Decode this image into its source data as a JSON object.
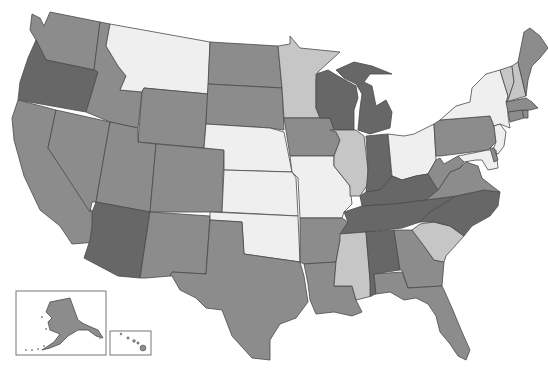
{
  "map": {
    "type": "choropleth",
    "region": "United States",
    "palette": {
      "very_light": "#efefef",
      "light": "#c6c6c6",
      "medium": "#8c8c8c",
      "dark": "#676767",
      "border": "#4a4a4a",
      "background": "#ffffff"
    },
    "insets": [
      {
        "name": "Alaska",
        "shade": "medium"
      },
      {
        "name": "Hawaii",
        "shade": "medium"
      }
    ],
    "states": [
      {
        "abbr": "WA",
        "shade": "medium",
        "points": "32,14 40,18 44,26 50,12 100,22 94,70 46,60 40,48 36,40 30,30"
      },
      {
        "abbr": "OR",
        "shade": "dark",
        "points": "36,40 46,60 94,70 98,72 86,112 18,100 20,82 28,58"
      },
      {
        "abbr": "CA",
        "shade": "medium",
        "points": "18,100 56,110 48,148 102,226 98,242 72,244 60,226 40,210 24,176 14,140 12,118"
      },
      {
        "abbr": "NV",
        "shade": "medium",
        "points": "56,110 110,122 96,202 92,202 90,212 48,148"
      },
      {
        "abbr": "ID",
        "shade": "medium",
        "points": "100,22 110,24 106,46 118,66 126,76 120,90 142,92 138,128 110,122 86,112 98,72 94,70"
      },
      {
        "abbr": "MT",
        "shade": "very_light",
        "points": "110,24 210,42 208,94 144,88 142,92 120,90 126,76 118,66 106,46"
      },
      {
        "abbr": "WY",
        "shade": "medium",
        "points": "144,88 208,94 204,148 138,142 142,92"
      },
      {
        "abbr": "UT",
        "shade": "medium",
        "points": "110,122 138,128 138,142 156,144 150,212 96,202"
      },
      {
        "abbr": "AZ",
        "shade": "dark",
        "points": "96,202 150,212 140,278 118,276 84,258 90,240 92,226 92,212"
      },
      {
        "abbr": "CO",
        "shade": "medium",
        "points": "156,144 224,150 222,212 150,212"
      },
      {
        "abbr": "NM",
        "shade": "medium",
        "points": "150,212 210,216 206,274 172,272 170,276 146,278 140,278"
      },
      {
        "abbr": "ND",
        "shade": "medium",
        "points": "210,42 278,46 282,88 208,84"
      },
      {
        "abbr": "SD",
        "shade": "medium",
        "points": "208,84 282,88 284,130 270,128 206,124"
      },
      {
        "abbr": "NE",
        "shade": "very_light",
        "points": "206,124 270,128 284,132 292,172 224,170 224,150 204,148"
      },
      {
        "abbr": "KS",
        "shade": "very_light",
        "points": "224,170 292,172 296,178 298,216 222,212"
      },
      {
        "abbr": "OK",
        "shade": "very_light",
        "points": "210,212 298,216 300,262 272,258 244,254 242,222 210,220"
      },
      {
        "abbr": "TX",
        "shade": "medium",
        "points": "210,220 242,222 244,254 272,258 300,262 304,276 308,302 296,318 280,324 270,340 270,360 252,358 232,336 222,310 206,308 196,298 180,290 172,276 170,276 172,272 206,274"
      },
      {
        "abbr": "MN",
        "shade": "light",
        "points": "278,46 290,44 290,36 300,48 340,52 318,72 316,80 316,108 320,118 284,118 282,88"
      },
      {
        "abbr": "IA",
        "shade": "medium",
        "points": "284,118 330,118 336,132 340,140 334,156 290,156"
      },
      {
        "abbr": "MO",
        "shade": "very_light",
        "points": "290,156 334,156 334,166 350,186 352,204 344,212 342,218 300,218 298,178 292,172"
      },
      {
        "abbr": "AR",
        "shade": "medium",
        "points": "300,218 342,218 348,222 340,240 336,262 304,264 300,262"
      },
      {
        "abbr": "LA",
        "shade": "medium",
        "points": "304,264 336,262 334,286 352,286 356,300 362,312 352,316 334,312 316,314 310,300 308,284"
      },
      {
        "abbr": "WI",
        "shade": "dark",
        "points": "316,74 328,70 338,76 356,86 358,98 354,110 354,130 334,130 330,118 320,118 316,108"
      },
      {
        "abbr": "IL",
        "shade": "light",
        "points": "330,130 356,130 364,136 368,170 368,184 360,196 350,196 350,186 334,166 334,156 340,140 336,132"
      },
      {
        "abbr": "MI",
        "shade": "dark",
        "points": "336,70 354,62 372,66 392,74 370,74 364,82 372,86 376,106 386,100 392,112 390,128 370,134 358,130 360,108 362,94 356,84 344,78"
      },
      {
        "abbr": "IN",
        "shade": "dark",
        "points": "366,136 388,134 392,182 380,190 366,192 368,170"
      },
      {
        "abbr": "OH",
        "shade": "very_light",
        "points": "388,134 404,136 414,134 434,124 436,160 428,174 416,176 402,180 392,176"
      },
      {
        "abbr": "KY",
        "shade": "dark",
        "points": "360,196 366,192 380,190 392,176 402,180 416,176 428,174 438,190 426,200 394,204 362,206"
      },
      {
        "abbr": "TN",
        "shade": "dark",
        "points": "344,212 362,206 394,204 426,200 456,196 430,212 420,222 402,228 366,232 340,234 348,222"
      },
      {
        "abbr": "MS",
        "shade": "light",
        "points": "340,234 366,232 370,280 372,296 356,300 352,286 334,286 336,262 340,240"
      },
      {
        "abbr": "AL",
        "shade": "dark",
        "points": "366,232 394,230 400,270 374,274 376,294 370,296 370,280"
      },
      {
        "abbr": "GA",
        "shade": "medium",
        "points": "394,230 412,230 424,246 434,260 444,262 442,286 408,288 402,270 400,270"
      },
      {
        "abbr": "FL",
        "shade": "medium",
        "points": "374,274 402,272 408,288 442,286 444,290 452,308 462,332 470,350 466,360 458,356 450,344 440,332 436,316 428,304 416,298 404,300 390,292 376,294"
      },
      {
        "abbr": "SC",
        "shade": "light",
        "points": "420,224 434,222 450,226 464,236 446,256 444,262 434,260 424,246 412,230"
      },
      {
        "abbr": "NC",
        "shade": "dark",
        "points": "420,222 430,212 456,196 484,190 500,192 498,206 490,216 472,226 464,236 450,226 434,222"
      },
      {
        "abbr": "VA",
        "shade": "medium",
        "points": "426,200 438,190 450,172 460,168 466,162 478,166 482,178 492,186 500,192 484,190 456,196"
      },
      {
        "abbr": "WV",
        "shade": "medium",
        "points": "428,174 436,160 440,158 444,164 458,156 464,162 460,168 450,172 438,190"
      },
      {
        "abbr": "PA",
        "shade": "medium",
        "points": "434,124 440,120 490,116 494,126 496,142 488,150 440,156 436,156"
      },
      {
        "abbr": "NY",
        "shade": "very_light",
        "points": "440,120 456,106 470,102 472,88 486,74 500,70 508,96 508,116 510,128 500,124 494,126 490,116"
      },
      {
        "abbr": "NJ",
        "shade": "very_light",
        "points": "494,126 500,124 506,132 504,146 498,154 492,152 496,142"
      },
      {
        "abbr": "MD",
        "shade": "very_light",
        "points": "458,156 488,150 496,150 498,168 488,170 482,160 476,160 464,162"
      },
      {
        "abbr": "DE",
        "shade": "medium",
        "points": "490,148 494,148 498,160 494,162"
      },
      {
        "abbr": "CT",
        "shade": "medium",
        "points": "508,112 522,110 524,118 510,122"
      },
      {
        "abbr": "RI",
        "shade": "medium",
        "points": "522,110 528,110 528,118 524,118"
      },
      {
        "abbr": "MA",
        "shade": "medium",
        "points": "506,102 526,98 532,102 538,108 530,110 522,110 508,112"
      },
      {
        "abbr": "VT",
        "shade": "light",
        "points": "500,70 512,66 514,82 508,100 506,102 508,96"
      },
      {
        "abbr": "NH",
        "shade": "light",
        "points": "512,66 518,62 526,96 506,102 508,100 514,82"
      },
      {
        "abbr": "ME",
        "shade": "medium",
        "points": "518,62 524,32 530,28 540,36 548,48 540,58 532,66 528,80 526,96"
      }
    ],
    "alaska_inset_frame": {
      "x": 16,
      "y": 291,
      "w": 90,
      "h": 64
    },
    "hawaii_inset_frame": {
      "x": 110,
      "y": 331,
      "w": 41,
      "h": 24
    }
  }
}
